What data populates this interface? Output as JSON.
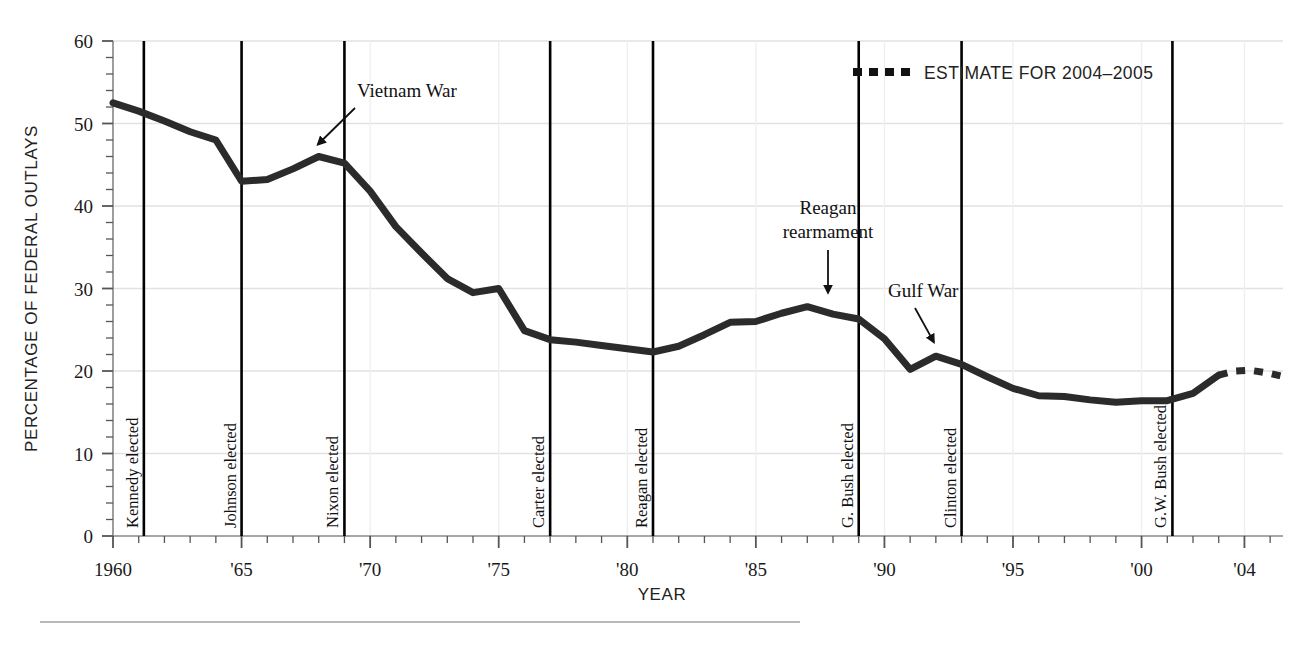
{
  "chart_data": {
    "type": "line",
    "title": "",
    "xlabel": "YEAR",
    "ylabel": "PERCENTAGE OF FEDERAL OUTLAYS",
    "xlim": [
      1960,
      2005.5
    ],
    "ylim": [
      0,
      60
    ],
    "grid": true,
    "x_ticks_major": [
      1960,
      1965,
      1970,
      1975,
      1980,
      1985,
      1990,
      1995,
      2000,
      2004
    ],
    "x_tick_labels": [
      "1960",
      "'65",
      "'70",
      "'75",
      "'80",
      "'85",
      "'90",
      "'95",
      "'00",
      "'04"
    ],
    "x_tick_minor_step": 1,
    "y_ticks_major": [
      0,
      10,
      20,
      30,
      40,
      50,
      60
    ],
    "y_tick_labels": [
      "0",
      "10",
      "20",
      "30",
      "40",
      "50",
      "60"
    ],
    "y_tick_minor_step": 2,
    "series": [
      {
        "name": "Defense share of federal outlays (actual)",
        "style": "solid",
        "x": [
          1960,
          1961,
          1962,
          1963,
          1964,
          1965,
          1966,
          1967,
          1968,
          1969,
          1970,
          1971,
          1972,
          1973,
          1974,
          1975,
          1976,
          1977,
          1978,
          1979,
          1980,
          1981,
          1982,
          1983,
          1984,
          1985,
          1986,
          1987,
          1988,
          1989,
          1990,
          1991,
          1992,
          1993,
          1994,
          1995,
          1996,
          1997,
          1998,
          1999,
          2000,
          2001,
          2002,
          2003
        ],
        "values": [
          52.5,
          51.5,
          50.3,
          49.0,
          48.0,
          43.0,
          43.2,
          44.5,
          46.0,
          45.2,
          41.8,
          37.5,
          34.3,
          31.2,
          29.5,
          30.0,
          24.9,
          23.8,
          23.5,
          23.1,
          22.7,
          22.3,
          23.0,
          24.4,
          25.9,
          26.0,
          27.0,
          27.8,
          26.9,
          26.3,
          23.9,
          20.2,
          21.8,
          20.8,
          19.3,
          17.9,
          17.0,
          16.9,
          16.5,
          16.2,
          16.4,
          16.4,
          17.3,
          19.5
        ]
      },
      {
        "name": "ESTIMATE FOR 2004-2005",
        "style": "dashed",
        "x": [
          2003,
          2003.6,
          2004.2,
          2005,
          2005.4
        ],
        "values": [
          19.5,
          20.0,
          20.1,
          19.7,
          19.4
        ]
      }
    ],
    "legend": {
      "position": "top-right",
      "entries": [
        {
          "label": "ESTIMATE FOR 2004–2005",
          "style": "dashed",
          "color": "#111111"
        }
      ]
    },
    "event_lines": [
      {
        "year": 1961.2,
        "label": "Kennedy elected"
      },
      {
        "year": 1965.0,
        "label": "Johnson elected"
      },
      {
        "year": 1969.0,
        "label": "Nixon elected"
      },
      {
        "year": 1977.0,
        "label": "Carter elected"
      },
      {
        "year": 1981.0,
        "label": "Reagan elected"
      },
      {
        "year": 1989.0,
        "label": "G. Bush elected"
      },
      {
        "year": 1993.0,
        "label": "Clinton elected"
      },
      {
        "year": 2001.2,
        "label": "G.W. Bush elected"
      }
    ],
    "annotations": [
      {
        "label": "Vietnam War",
        "target_year": 1968.2,
        "target_value": 46.0
      },
      {
        "label": "Reagan\nrearmament",
        "line1": "Reagan",
        "line2": "rearmament",
        "target_year": 1987.0,
        "target_value": 27.8
      },
      {
        "label": "Gulf War",
        "target_year": 1992.0,
        "target_value": 21.8
      }
    ],
    "colors": {
      "line": "#2b2b2b",
      "grid": "#e2e2e2",
      "axis": "#7a7a7a",
      "event_line": "#000000",
      "text": "#1a1a1a",
      "footer_rule": "#b9b9b9"
    }
  }
}
